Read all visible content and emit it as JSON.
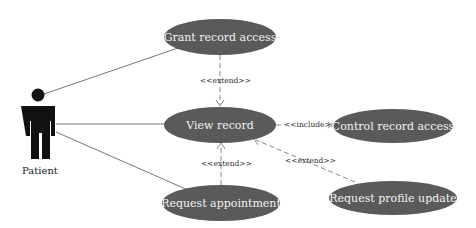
{
  "diagram": {
    "type": "uml-use-case",
    "colors": {
      "usecase_fill": "#5a5a5a",
      "usecase_text": "#f2f2f2",
      "line": "#777777",
      "actor": "#111111"
    },
    "actor": {
      "label": "Patient"
    },
    "use_cases": [
      {
        "id": "grant",
        "label": "Grant record access"
      },
      {
        "id": "view",
        "label": "View record"
      },
      {
        "id": "control",
        "label": "Control record access"
      },
      {
        "id": "appointment",
        "label": "Request appointment"
      },
      {
        "id": "profile",
        "label": "Request profile update"
      }
    ],
    "relations": [
      {
        "from": "Patient",
        "to": "Grant record access",
        "type": "association"
      },
      {
        "from": "Patient",
        "to": "View record",
        "type": "association"
      },
      {
        "from": "Patient",
        "to": "Request appointment",
        "type": "association"
      },
      {
        "from": "Grant record access",
        "to": "View record",
        "type": "extend",
        "label": "<<extend>>"
      },
      {
        "from": "View record",
        "to": "Control record access",
        "type": "include",
        "label": "<<include>>"
      },
      {
        "from": "Request appointment",
        "to": "View record",
        "type": "extend",
        "label": "<<extend>>"
      },
      {
        "from": "Request profile update",
        "to": "View record",
        "type": "extend",
        "label": "<<extend>>"
      }
    ]
  }
}
